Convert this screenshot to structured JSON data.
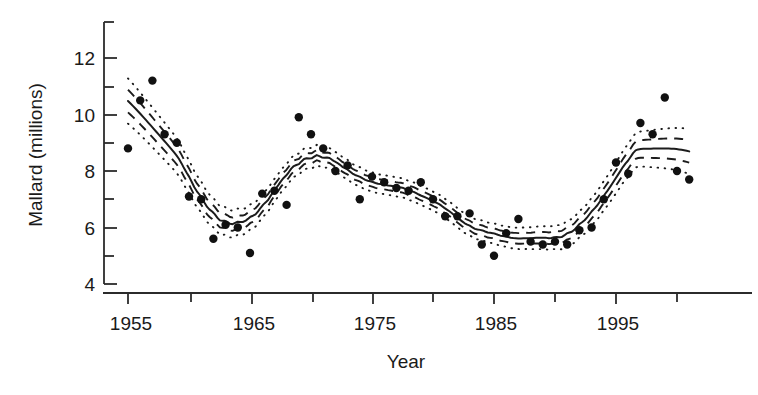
{
  "figure": {
    "title": "",
    "background_color": "#ffffff",
    "ink_color": "#1a1a1a"
  },
  "axes": {
    "y_title": "Mallard (millions)",
    "x_title": "Year",
    "y_major_labels": [
      "4",
      "6",
      "8",
      "10",
      "12"
    ],
    "x_major_labels": [
      "1955",
      "1965",
      "1975",
      "1985",
      "1995"
    ]
  },
  "chart_data": {
    "type": "scatter",
    "title": "",
    "xlabel": "Year",
    "ylabel": "Mallard (millions)",
    "xlim": [
      1954,
      2002
    ],
    "ylim": [
      4,
      13
    ],
    "grid": false,
    "legend": null,
    "x_ticks_major": [
      1955,
      1965,
      1975,
      1985,
      1995
    ],
    "x_ticks_minor": [
      1960,
      1970,
      1980,
      1990,
      2000
    ],
    "y_ticks_major": [
      4,
      6,
      8,
      10,
      12
    ],
    "y_ticks_minor": [
      5,
      7,
      9,
      11,
      13
    ],
    "series": [
      {
        "name": "Observed mallard abundance",
        "type": "scatter",
        "marker": "filled-circle",
        "color": "#111111",
        "x": [
          1955,
          1956,
          1957,
          1958,
          1959,
          1960,
          1961,
          1962,
          1963,
          1964,
          1965,
          1966,
          1967,
          1968,
          1969,
          1970,
          1971,
          1972,
          1973,
          1974,
          1975,
          1976,
          1977,
          1978,
          1979,
          1980,
          1981,
          1982,
          1983,
          1984,
          1985,
          1986,
          1987,
          1988,
          1989,
          1990,
          1991,
          1992,
          1993,
          1994,
          1995,
          1996,
          1997,
          1998,
          1999,
          2000,
          2001
        ],
        "y": [
          8.8,
          10.5,
          11.2,
          9.3,
          9.0,
          7.1,
          7.0,
          5.6,
          6.1,
          6.0,
          5.1,
          7.2,
          7.3,
          6.8,
          9.9,
          9.3,
          8.8,
          8.0,
          8.2,
          7.0,
          7.8,
          7.6,
          7.4,
          7.3,
          7.6,
          7.0,
          6.4,
          6.4,
          6.5,
          5.4,
          5.0,
          5.8,
          6.3,
          5.5,
          5.4,
          5.5,
          5.4,
          5.9,
          6.0,
          7.0,
          8.3,
          7.9,
          9.7,
          9.3,
          10.6,
          8.0,
          7.7
        ]
      },
      {
        "name": "Fitted trend (solid)",
        "type": "line",
        "style": "solid",
        "color": "#1c1c1c"
      },
      {
        "name": "Inner interval (dashed)",
        "type": "band",
        "style": "dashed",
        "color": "#1c1c1c"
      },
      {
        "name": "Outer interval (dotted)",
        "type": "band",
        "style": "dotted",
        "color": "#1c1c1c"
      }
    ],
    "annotations": []
  }
}
